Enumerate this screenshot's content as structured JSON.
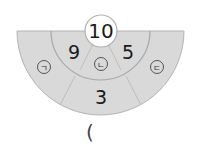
{
  "diagram": {
    "center_value": "10",
    "inner_left_value": "9",
    "inner_right_value": "5",
    "outer_bottom_value": "3",
    "labels": {
      "left": "ㄱ",
      "middle": "ㄴ",
      "right": "ㄷ"
    },
    "answer_open_paren": "(",
    "colors": {
      "fill": "#d9d9d9",
      "stroke": "#a8a8a8",
      "circle_fill": "#ffffff",
      "text": "#1a1a1a"
    }
  }
}
